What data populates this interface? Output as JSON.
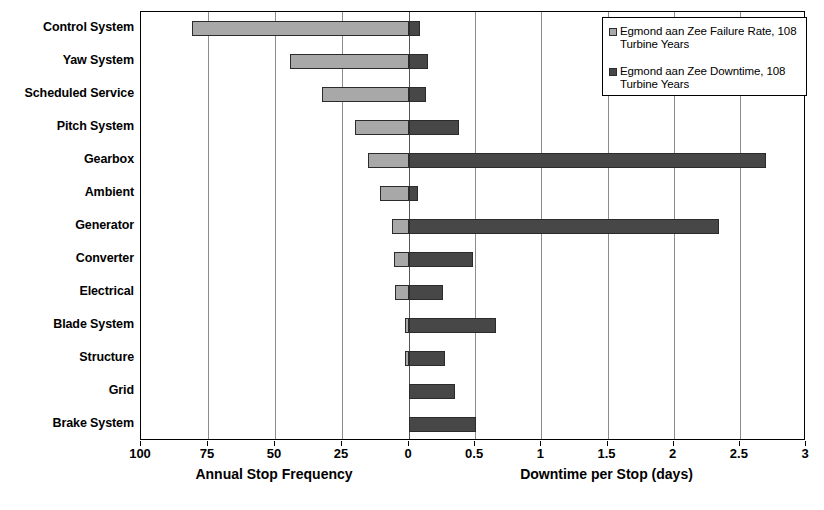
{
  "chart_data": {
    "type": "bar",
    "orientation": "horizontal",
    "style": "back-to-back diverging bar chart",
    "title": "",
    "categories": [
      "Control System",
      "Yaw System",
      "Scheduled Service",
      "Pitch System",
      "Gearbox",
      "Ambient",
      "Generator",
      "Converter",
      "Electrical",
      "Blade System",
      "Structure",
      "Grid",
      "Brake System"
    ],
    "series": [
      {
        "name": "Egmond aan Zee Failure Rate, 108 Turbine Years",
        "key": "failure_rate",
        "axis": "left",
        "color": "#a8a8a8",
        "units": "Annual Stop Frequency",
        "values": [
          81.0,
          44.5,
          32.6,
          20.2,
          15.4,
          10.9,
          6.4,
          5.6,
          5.2,
          1.5,
          1.5,
          0.0,
          0.0
        ]
      },
      {
        "name": "Egmond aan Zee Downtime, 108 Turbine Years",
        "key": "downtime",
        "axis": "right",
        "color": "#474747",
        "units": "days",
        "values": [
          0.08,
          0.14,
          0.13,
          0.38,
          2.7,
          0.07,
          2.34,
          0.48,
          0.26,
          0.66,
          0.27,
          0.35,
          0.51
        ]
      }
    ],
    "left_axis": {
      "label": "Annual Stop Frequency",
      "ticks": [
        "100",
        "75",
        "50",
        "25",
        "0"
      ],
      "tick_values": [
        100,
        75,
        50,
        25,
        0
      ],
      "min": 0,
      "max": 100,
      "direction": "reversed"
    },
    "right_axis": {
      "label": "Downtime per Stop (days)",
      "ticks": [
        "0",
        "0.5",
        "1",
        "1.5",
        "2",
        "2.5",
        "3"
      ],
      "tick_values": [
        0,
        0.5,
        1,
        1.5,
        2,
        2.5,
        3
      ],
      "min": 0,
      "max": 3
    },
    "grid": true,
    "legend_position": "top-right"
  },
  "legend": {
    "items": [
      {
        "label": "Egmond aan Zee Failure Rate, 108 Turbine Years",
        "swatch": "light"
      },
      {
        "label": "Egmond aan Zee Downtime, 108 Turbine Years",
        "swatch": "dark"
      }
    ]
  },
  "colors": {
    "failure_rate": "#a8a8a8",
    "downtime": "#474747",
    "gridline": "#8c8c8c",
    "axis": "#000000",
    "background": "#ffffff"
  }
}
